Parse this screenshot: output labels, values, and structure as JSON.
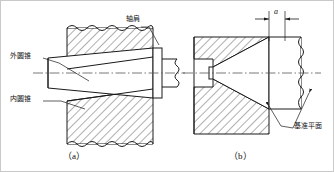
{
  "figure": {
    "title_internal": "tapered-cone-fit-diagram",
    "colors": {
      "line": "#1a1a1a",
      "hatch": "#1a1a1a",
      "centerline": "#555555",
      "border": "#c9c9c9",
      "background": "#ffffff"
    },
    "labels": {
      "outer_cone": "外圆锥",
      "inner_cone": "内圆锥",
      "shaft_shoulder": "轴肩",
      "datum_plane": "基准平面",
      "dimension_a": "a"
    },
    "captions": {
      "left": "（a）",
      "right": "（b）"
    },
    "views": [
      {
        "id": "view-a",
        "caption": "（a）",
        "description": "cone seated against shaft shoulder",
        "annotations": [
          "外圆锥",
          "内圆锥",
          "轴肩"
        ]
      },
      {
        "id": "view-b",
        "caption": "（b）",
        "description": "cone with axial clearance a from datum plane",
        "annotations": [
          "a",
          "基准平面"
        ]
      }
    ]
  }
}
